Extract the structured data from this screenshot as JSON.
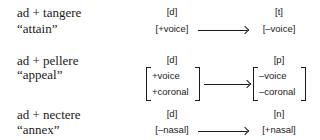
{
  "examples": [
    {
      "latin": "ad + tangere",
      "gloss": "“attain”",
      "input_segment": "[d]",
      "input_features": "[+voice]",
      "output_segment": "[t]",
      "output_features": "[–voice]"
    },
    {
      "latin": "ad + pellere",
      "gloss": "“appeal”",
      "input_segment": "[d]",
      "input_features": [
        "+voice",
        "+coronal"
      ],
      "output_segment": "[p]",
      "output_features": [
        "–voice",
        "–coronal"
      ]
    },
    {
      "latin": "ad + nectere",
      "gloss": "“annex”",
      "input_segment": "[d]",
      "input_features": "[–nasal]",
      "output_segment": "[n]",
      "output_features": "[+nasal]"
    }
  ],
  "arrow_icon": "right-arrow"
}
